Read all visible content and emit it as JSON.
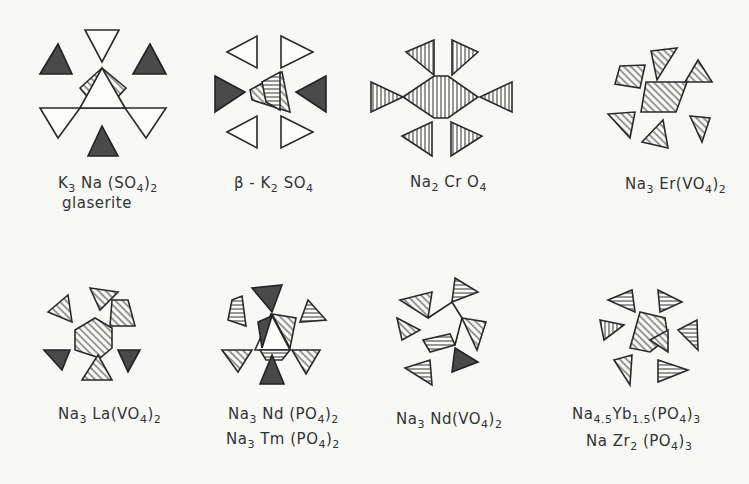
{
  "figure": {
    "panels": [
      {
        "id": "k3na-so4-2",
        "formula_parts": [
          [
            "K",
            "3"
          ],
          [
            " Na (SO",
            "4"
          ],
          [
            ")",
            "2"
          ]
        ],
        "line2": "glaserite"
      },
      {
        "id": "beta-k2so4",
        "formula_parts": [
          [
            "β - K",
            "2"
          ],
          [
            " SO",
            "4"
          ]
        ],
        "line2": ""
      },
      {
        "id": "na2cro4",
        "formula_parts": [
          [
            "Na",
            "2"
          ],
          [
            " Cr O",
            "4"
          ]
        ],
        "line2": ""
      },
      {
        "id": "na3er-vo4-2",
        "formula_parts": [
          [
            "Na",
            "3"
          ],
          [
            " Er(VO",
            "4"
          ],
          [
            ")",
            "2"
          ]
        ],
        "line2": ""
      },
      {
        "id": "na3la-vo4-2",
        "formula_parts": [
          [
            "Na",
            "3"
          ],
          [
            " La(VO",
            "4"
          ],
          [
            ")",
            "2"
          ]
        ],
        "line2": ""
      },
      {
        "id": "na3nd-po4-2",
        "formula_parts": [
          [
            "Na",
            "3"
          ],
          [
            " Nd (PO",
            "4"
          ],
          [
            ")",
            "2"
          ]
        ],
        "line2_parts": [
          [
            "Na",
            "3"
          ],
          [
            " Tm (PO",
            "4"
          ],
          [
            ")",
            "2"
          ]
        ]
      },
      {
        "id": "na3nd-vo4-2",
        "formula_parts": [
          [
            "Na",
            "3"
          ],
          [
            " Nd(VO",
            "4"
          ],
          [
            ")",
            "2"
          ]
        ],
        "line2": ""
      },
      {
        "id": "na45yb15-po4-3",
        "formula_parts": [
          [
            "Na",
            "4.5"
          ],
          [
            "Yb",
            "1.5"
          ],
          [
            "(PO",
            "4"
          ],
          [
            ")",
            "3"
          ]
        ],
        "line2_parts": [
          [
            "Na  Zr",
            "2"
          ],
          [
            " (PO",
            "4"
          ],
          [
            ")",
            "3"
          ]
        ]
      }
    ],
    "labels": {
      "p0a": "K",
      "p0b": "3",
      "p0c": " Na (SO",
      "p0d": "4",
      "p0e": ")",
      "p0f": "2",
      "p0g": "glaserite",
      "p1a": "β - K",
      "p1b": "2",
      "p1c": " SO",
      "p1d": "4",
      "p2a": "Na",
      "p2b": "2",
      "p2c": " Cr O",
      "p2d": "4",
      "p3a": "Na",
      "p3b": "3",
      "p3c": " Er(VO",
      "p3d": "4",
      "p3e": ")",
      "p3f": "2",
      "p4a": "Na",
      "p4b": "3",
      "p4c": " La(VO",
      "p4d": "4",
      "p4e": ")",
      "p4f": "2",
      "p5a": "Na",
      "p5b": "3",
      "p5c": " Nd (PO",
      "p5d": "4",
      "p5e": ")",
      "p5f": "2",
      "p5g": "Na",
      "p5h": "3",
      "p5i": " Tm (PO",
      "p5j": "4",
      "p5k": ")",
      "p5l": "2",
      "p6a": "Na",
      "p6b": "3",
      "p6c": " Nd(VO",
      "p6d": "4",
      "p6e": ")",
      "p6f": "2",
      "p7a": "Na",
      "p7b": "4.5",
      "p7c": "Yb",
      "p7d": "1.5",
      "p7e": "(PO",
      "p7f": "4",
      "p7g": ")",
      "p7h": "3",
      "p7i": "Na  Zr",
      "p7j": "2",
      "p7k": " (PO",
      "p7l": "4",
      "p7m": ")",
      "p7n": "3"
    }
  }
}
